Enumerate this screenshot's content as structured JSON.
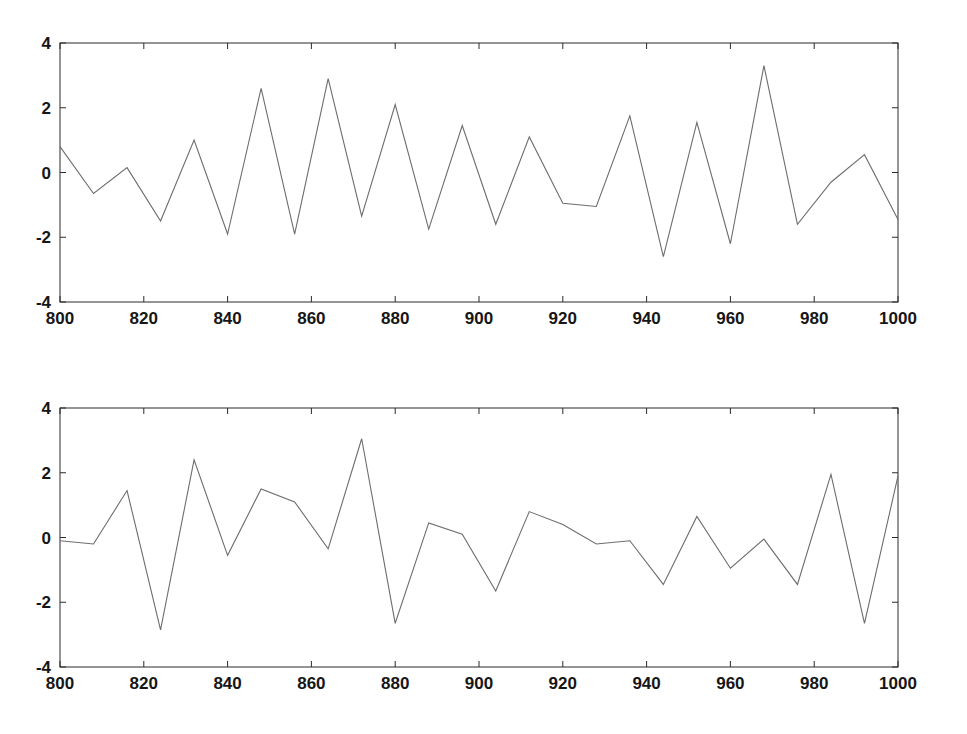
{
  "figure": {
    "background_color": "#ffffff",
    "line_color": "#6d6d6d",
    "axis_color": "#2b2b2b",
    "panel_count": 2
  },
  "chart_data": [
    {
      "type": "line",
      "id": "top-series",
      "title": "",
      "subtitle": "",
      "xlabel": "",
      "ylabel": "",
      "xlim": [
        800,
        1000
      ],
      "ylim": [
        -4,
        4
      ],
      "xticks": [
        800,
        820,
        840,
        860,
        880,
        900,
        920,
        940,
        960,
        980,
        1000
      ],
      "xticklabels": [
        "800",
        "820",
        "840",
        "860",
        "880",
        "900",
        "920",
        "940",
        "960",
        "980",
        "1000"
      ],
      "yticks": [
        -4,
        -2,
        0,
        2,
        4
      ],
      "yticklabels": [
        "-4",
        "-2",
        "0",
        "2",
        "4"
      ],
      "grid": false,
      "legend": null,
      "legend_position": "none",
      "annotations": [],
      "x": [
        800,
        808,
        816,
        824,
        832,
        840,
        848,
        856,
        864,
        872,
        880,
        888,
        896,
        904,
        912,
        920,
        928,
        936,
        944,
        952,
        960,
        968,
        976,
        984,
        992,
        1000
      ],
      "y": [
        0.8,
        -0.65,
        0.15,
        -1.5,
        1.0,
        -1.9,
        2.6,
        -1.9,
        2.9,
        -1.35,
        2.1,
        -1.75,
        1.45,
        -1.6,
        1.1,
        -0.95,
        -1.05,
        1.75,
        -2.6,
        1.55,
        -2.2,
        3.3,
        -1.6,
        -0.3,
        0.55,
        -1.45
      ]
    },
    {
      "type": "line",
      "id": "bottom-series",
      "title": "",
      "subtitle": "",
      "xlabel": "",
      "ylabel": "",
      "xlim": [
        800,
        1000
      ],
      "ylim": [
        -4,
        4
      ],
      "xticks": [
        800,
        820,
        840,
        860,
        880,
        900,
        920,
        940,
        960,
        980,
        1000
      ],
      "xticklabels": [
        "800",
        "820",
        "840",
        "860",
        "880",
        "900",
        "920",
        "940",
        "960",
        "980",
        "1000"
      ],
      "yticks": [
        -4,
        -2,
        0,
        2,
        4
      ],
      "yticklabels": [
        "-4",
        "-2",
        "0",
        "2",
        "4"
      ],
      "grid": false,
      "legend": null,
      "legend_position": "none",
      "annotations": [],
      "x": [
        800,
        808,
        816,
        824,
        832,
        840,
        848,
        856,
        864,
        872,
        880,
        888,
        896,
        904,
        912,
        920,
        928,
        936,
        944,
        952,
        960,
        968,
        976,
        984,
        992,
        1000
      ],
      "y": [
        -0.1,
        -0.2,
        1.45,
        -2.85,
        2.4,
        -0.55,
        1.5,
        1.1,
        -0.35,
        3.05,
        -2.65,
        0.45,
        0.1,
        -1.65,
        0.8,
        0.4,
        -0.2,
        -0.1,
        -1.45,
        0.65,
        -0.95,
        -0.05,
        -1.45,
        1.95,
        -2.65,
        1.9
      ]
    }
  ]
}
